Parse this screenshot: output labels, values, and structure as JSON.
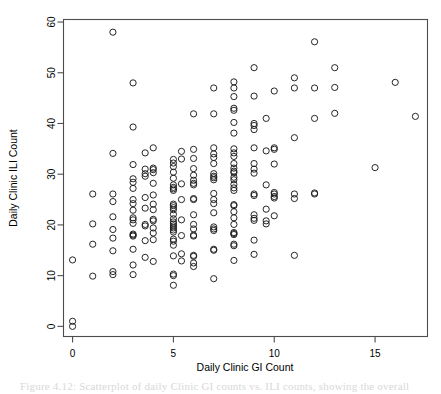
{
  "figure": {
    "background_color": "#ffffff",
    "frame_color": "#4d4d4d",
    "point_color": "#1a1a1a",
    "caption_partial": "Figure 4.12: Scatterplot of daily Clinic GI counts vs. ILI counts, showing the overall"
  },
  "chart_data": {
    "type": "scatter",
    "title": "",
    "xlabel": "Daily Clinic GI Count",
    "ylabel": "Daily Clinic ILI Count",
    "xlim": [
      -0.45,
      17.6
    ],
    "ylim": [
      -2.0,
      60.5
    ],
    "xticks": [
      0,
      5,
      10,
      15
    ],
    "yticks": [
      0,
      10,
      20,
      30,
      40,
      50,
      60
    ],
    "xtick_labels": [
      "0",
      "5",
      "10",
      "15"
    ],
    "ytick_labels": [
      "0",
      "10",
      "20",
      "30",
      "40",
      "50",
      "60"
    ],
    "grid": false,
    "legend": null,
    "marker": "open-circle",
    "marker_size": 3.1,
    "series": [
      {
        "name": "Daily clinic counts",
        "points": [
          [
            0,
            0
          ],
          [
            0,
            1
          ],
          [
            0,
            13.1
          ],
          [
            1,
            9.9
          ],
          [
            1,
            16.2
          ],
          [
            1,
            20.2
          ],
          [
            1,
            26.1
          ],
          [
            2,
            10.2
          ],
          [
            2,
            10.8
          ],
          [
            2,
            14.9
          ],
          [
            2,
            17.4
          ],
          [
            2,
            19.1
          ],
          [
            2,
            21.6
          ],
          [
            2,
            24.6
          ],
          [
            2,
            26.1
          ],
          [
            2,
            34.1
          ],
          [
            2,
            58.0
          ],
          [
            3,
            10.2
          ],
          [
            3,
            12.1
          ],
          [
            3,
            15.2
          ],
          [
            3,
            17.8
          ],
          [
            3,
            18.0
          ],
          [
            3,
            18.2
          ],
          [
            3,
            20.3
          ],
          [
            3,
            21.0
          ],
          [
            3,
            21.4
          ],
          [
            3,
            22.9
          ],
          [
            3,
            24.2
          ],
          [
            3,
            25.0
          ],
          [
            3,
            27.2
          ],
          [
            3,
            28.4
          ],
          [
            3,
            29.1
          ],
          [
            3,
            31.9
          ],
          [
            3,
            39.3
          ],
          [
            3,
            48.0
          ],
          [
            3.6,
            13.6
          ],
          [
            3.6,
            16.9
          ],
          [
            3.6,
            19.8
          ],
          [
            3.6,
            20.1
          ],
          [
            3.6,
            23.3
          ],
          [
            3.6,
            25.4
          ],
          [
            3.6,
            29.6
          ],
          [
            3.6,
            30.1
          ],
          [
            3.6,
            31.0
          ],
          [
            3.6,
            34.2
          ],
          [
            4,
            12.8
          ],
          [
            4,
            17.1
          ],
          [
            4,
            18.4
          ],
          [
            4,
            19.4
          ],
          [
            4,
            20.8
          ],
          [
            4,
            21.1
          ],
          [
            4,
            23.0
          ],
          [
            4,
            24.1
          ],
          [
            4,
            25.9
          ],
          [
            4,
            28.2
          ],
          [
            4,
            30.3
          ],
          [
            4,
            30.9
          ],
          [
            4,
            31.2
          ],
          [
            4,
            35.2
          ],
          [
            5,
            8.1
          ],
          [
            5,
            10.0
          ],
          [
            5,
            10.3
          ],
          [
            5,
            13.9
          ],
          [
            5,
            16.0
          ],
          [
            5,
            16.8
          ],
          [
            5,
            17.2
          ],
          [
            5,
            18.6
          ],
          [
            5,
            19.0
          ],
          [
            5,
            19.4
          ],
          [
            5,
            19.8
          ],
          [
            5,
            20.2
          ],
          [
            5,
            20.6
          ],
          [
            5,
            21.2
          ],
          [
            5,
            22.1
          ],
          [
            5,
            23.0
          ],
          [
            5,
            23.4
          ],
          [
            5,
            23.8
          ],
          [
            5,
            24.1
          ],
          [
            5,
            26.8
          ],
          [
            5,
            27.1
          ],
          [
            5,
            27.4
          ],
          [
            5,
            27.9
          ],
          [
            5,
            29.2
          ],
          [
            5,
            30.4
          ],
          [
            5,
            31.5
          ],
          [
            5,
            32.2
          ],
          [
            5,
            32.9
          ],
          [
            5.4,
            12.9
          ],
          [
            5.4,
            14.3
          ],
          [
            5.4,
            17.9
          ],
          [
            5.4,
            21.0
          ],
          [
            5.4,
            25.0
          ],
          [
            5.4,
            28.1
          ],
          [
            5.4,
            33.0
          ],
          [
            5.4,
            34.5
          ],
          [
            6,
            11.8
          ],
          [
            6,
            12.5
          ],
          [
            6,
            13.8
          ],
          [
            6,
            14.0
          ],
          [
            6,
            17.8
          ],
          [
            6,
            18.0
          ],
          [
            6,
            19.2
          ],
          [
            6,
            20.1
          ],
          [
            6,
            22.0
          ],
          [
            6,
            25.0
          ],
          [
            6,
            25.2
          ],
          [
            6,
            27.9
          ],
          [
            6,
            28.2
          ],
          [
            6,
            28.8
          ],
          [
            6,
            29.8
          ],
          [
            6,
            31.1
          ],
          [
            6,
            33.1
          ],
          [
            6,
            34.9
          ],
          [
            6,
            41.9
          ],
          [
            7,
            9.4
          ],
          [
            7,
            15.0
          ],
          [
            7,
            15.2
          ],
          [
            7,
            18.9
          ],
          [
            7,
            19.2
          ],
          [
            7,
            19.6
          ],
          [
            7,
            22.4
          ],
          [
            7,
            24.2
          ],
          [
            7,
            25.0
          ],
          [
            7,
            26.2
          ],
          [
            7,
            28.9
          ],
          [
            7,
            29.3
          ],
          [
            7,
            29.6
          ],
          [
            7,
            30.1
          ],
          [
            7,
            32.1
          ],
          [
            7,
            33.3
          ],
          [
            7,
            34.0
          ],
          [
            7,
            35.2
          ],
          [
            7,
            41.9
          ],
          [
            7,
            47.0
          ],
          [
            8,
            13.0
          ],
          [
            8,
            15.9
          ],
          [
            8,
            16.2
          ],
          [
            8,
            18.1
          ],
          [
            8,
            18.3
          ],
          [
            8,
            18.5
          ],
          [
            8,
            20.1
          ],
          [
            8,
            21.4
          ],
          [
            8,
            22.6
          ],
          [
            8,
            23.8
          ],
          [
            8,
            24.0
          ],
          [
            8,
            26.8
          ],
          [
            8,
            27.3
          ],
          [
            8,
            28.0
          ],
          [
            8,
            28.9
          ],
          [
            8,
            29.4
          ],
          [
            8,
            30.3
          ],
          [
            8,
            30.6
          ],
          [
            8,
            31.2
          ],
          [
            8,
            32.1
          ],
          [
            8,
            33.5
          ],
          [
            8,
            34.2
          ],
          [
            8,
            35.0
          ],
          [
            8,
            38.1
          ],
          [
            8,
            40.2
          ],
          [
            8,
            42.6
          ],
          [
            8,
            43.0
          ],
          [
            8,
            45.3
          ],
          [
            8,
            47.0
          ],
          [
            8,
            48.2
          ],
          [
            9,
            14.2
          ],
          [
            9,
            17.0
          ],
          [
            9,
            20.9
          ],
          [
            9,
            21.3
          ],
          [
            9,
            22.0
          ],
          [
            9,
            25.8
          ],
          [
            9,
            26.1
          ],
          [
            9,
            30.2
          ],
          [
            9,
            31.0
          ],
          [
            9,
            32.1
          ],
          [
            9,
            35.2
          ],
          [
            9,
            38.8
          ],
          [
            9,
            39.6
          ],
          [
            9,
            40.0
          ],
          [
            9,
            45.4
          ],
          [
            9,
            51.0
          ],
          [
            9.6,
            20.2
          ],
          [
            9.6,
            20.8
          ],
          [
            9.6,
            23.1
          ],
          [
            9.6,
            27.9
          ],
          [
            9.6,
            34.6
          ],
          [
            9.6,
            41.0
          ],
          [
            10,
            21.8
          ],
          [
            10,
            25.3
          ],
          [
            10,
            25.6
          ],
          [
            10,
            26.1
          ],
          [
            10,
            26.4
          ],
          [
            10,
            32.0
          ],
          [
            10,
            34.9
          ],
          [
            10,
            35.2
          ],
          [
            10,
            46.4
          ],
          [
            11,
            14.0
          ],
          [
            11,
            25.2
          ],
          [
            11,
            26.1
          ],
          [
            11,
            37.2
          ],
          [
            11,
            47.0
          ],
          [
            11,
            49.0
          ],
          [
            12,
            26.1
          ],
          [
            12,
            26.3
          ],
          [
            12,
            41.0
          ],
          [
            12,
            47.0
          ],
          [
            12,
            56.1
          ],
          [
            13,
            42.0
          ],
          [
            13,
            47.1
          ],
          [
            13,
            51.0
          ],
          [
            15,
            31.3
          ],
          [
            16,
            48.1
          ],
          [
            17,
            41.4
          ]
        ]
      }
    ]
  }
}
